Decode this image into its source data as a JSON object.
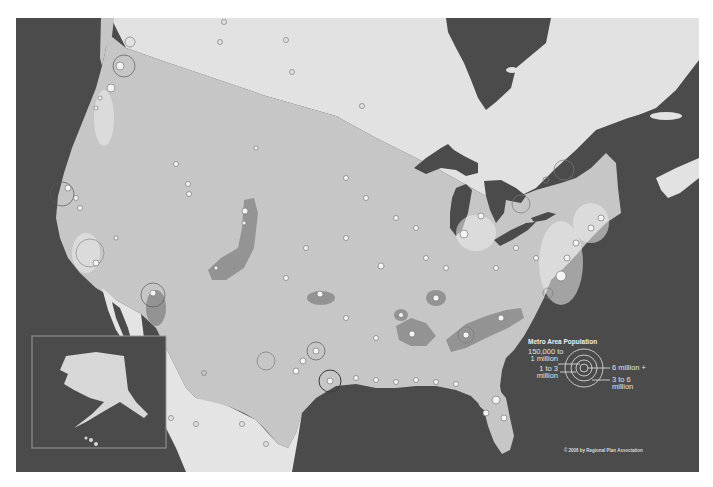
{
  "map": {
    "subject": "US megaregions with metro area population circles",
    "colors": {
      "ocean": "#4b4b4b",
      "canada_land": "#dcdcdc",
      "us_land": "#c4c4c4",
      "megaregion": "#8a8a8a",
      "city_circle": "#f2f2f2",
      "city_ring": "#6a6a6a",
      "frame_border": "#9a9a9a"
    },
    "inset": {
      "name": "Alaska and Hawaii inset"
    }
  },
  "legend": {
    "title": "Metro Area Population",
    "categories": [
      {
        "label_line1": "150,000 to",
        "label_line2": "1 million"
      },
      {
        "label_line1": "1 to 3",
        "label_line2": "million"
      },
      {
        "label_line1": "6 million +",
        "label_line2": ""
      },
      {
        "label_line1": "3 to 6",
        "label_line2": "million"
      }
    ]
  },
  "footer": {
    "copyright": "© 2006 by Regional Plan Association"
  }
}
